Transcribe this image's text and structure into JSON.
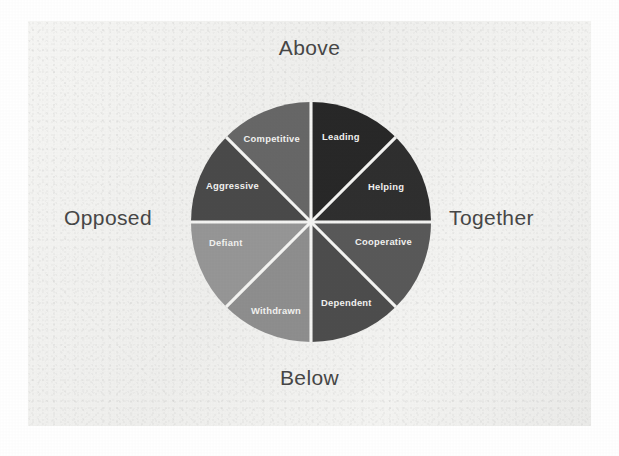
{
  "figure": {
    "kind": "interpersonal-circumplex-wheel",
    "page_background": "#f3f3f1",
    "divider_color": "#f4f4f2",
    "axis_label_color": "#474747",
    "segment_label_color": "#f2f2f0"
  },
  "axes": {
    "top": "Above",
    "right": "Together",
    "bottom": "Below",
    "left": "Opposed"
  },
  "chart_data": {
    "type": "pie",
    "title": "",
    "legend_position": "none",
    "grid": false,
    "center_x": 121,
    "center_y": 121,
    "radius": 120,
    "slice_count": 8,
    "slice_degrees": 45,
    "axis_labels": [
      "Above",
      "Together",
      "Below",
      "Opposed"
    ],
    "categories": [
      "Leading",
      "Helping",
      "Cooperative",
      "Dependent",
      "Withdrawn",
      "Defiant",
      "Aggressive",
      "Competitive"
    ],
    "values": [
      45,
      45,
      45,
      45,
      45,
      45,
      45,
      45
    ],
    "colors": [
      "#282828",
      "#2f2f2f",
      "#595959",
      "#4d4d4d",
      "#8e8e8e",
      "#969696",
      "#4a4a4a",
      "#676767"
    ],
    "slices": [
      {
        "label": "Leading",
        "color": "#282828",
        "start_angle": 0,
        "end_angle": 45,
        "label_x": 132,
        "label_y": 37,
        "anchor": "start"
      },
      {
        "label": "Helping",
        "color": "#2f2f2f",
        "start_angle": 45,
        "end_angle": 90,
        "label_x": 178,
        "label_y": 87,
        "anchor": "start"
      },
      {
        "label": "Cooperative",
        "color": "#595959",
        "start_angle": 90,
        "end_angle": 135,
        "label_x": 222,
        "label_y": 142,
        "anchor": "end"
      },
      {
        "label": "Dependent",
        "color": "#4d4d4d",
        "start_angle": 135,
        "end_angle": 180,
        "label_x": 131,
        "label_y": 203,
        "anchor": "start"
      },
      {
        "label": "Withdrawn",
        "color": "#8e8e8e",
        "start_angle": 180,
        "end_angle": 225,
        "label_x": 111,
        "label_y": 211,
        "anchor": "end"
      },
      {
        "label": "Defiant",
        "color": "#969696",
        "start_angle": 225,
        "end_angle": 270,
        "label_x": 19,
        "label_y": 143,
        "anchor": "start"
      },
      {
        "label": "Aggressive",
        "color": "#4a4a4a",
        "start_angle": 270,
        "end_angle": 315,
        "label_x": 16,
        "label_y": 86,
        "anchor": "start"
      },
      {
        "label": "Competitive",
        "color": "#676767",
        "start_angle": 315,
        "end_angle": 360,
        "label_x": 110,
        "label_y": 39,
        "anchor": "end"
      }
    ]
  }
}
